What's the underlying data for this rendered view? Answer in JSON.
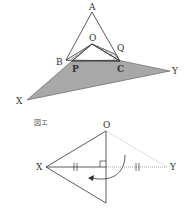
{
  "figure_top": {
    "labels": {
      "A": "A",
      "O": "O",
      "B": "B",
      "Q": "Q",
      "P": "P",
      "C": "C",
      "X": "X",
      "Y": "Y"
    },
    "colors": {
      "shaded": "#a6a6a6",
      "line": "#333333"
    }
  },
  "figure_bottom": {
    "caption": "図エ",
    "labels": {
      "O": "O",
      "X": "X",
      "Y": "Y"
    },
    "colors": {
      "line": "#333333",
      "dotted": "#999999"
    }
  }
}
